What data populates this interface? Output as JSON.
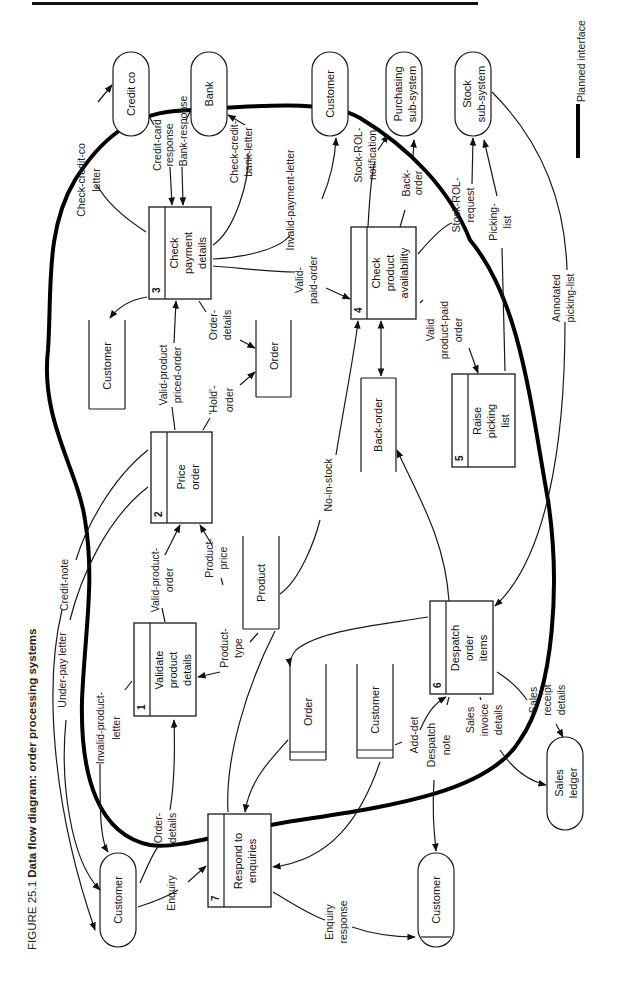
{
  "header": {
    "rule": true
  },
  "caption": {
    "figure_no": "FIGURE 25.1",
    "title": "Data flow diagram: order processing systems"
  },
  "legend": {
    "label": "Planned interface"
  },
  "processes": [
    {
      "num": "1",
      "label": [
        "Validate",
        "product",
        "details"
      ]
    },
    {
      "num": "2",
      "label": [
        "Price",
        "order"
      ]
    },
    {
      "num": "3",
      "label": [
        "Check",
        "payment",
        "details"
      ]
    },
    {
      "num": "4",
      "label": [
        "Check",
        "product",
        "availability"
      ]
    },
    {
      "num": "5",
      "label": [
        "Raise",
        "picking",
        "list"
      ]
    },
    {
      "num": "6",
      "label": [
        "Despatch",
        "order",
        "items"
      ]
    },
    {
      "num": "7",
      "label": [
        "Respond to",
        "enquiries"
      ]
    }
  ],
  "external_entities": [
    {
      "id": "credit-co",
      "label": [
        "Credit co"
      ]
    },
    {
      "id": "bank",
      "label": [
        "Bank"
      ]
    },
    {
      "id": "customer-top",
      "label": [
        "Customer"
      ]
    },
    {
      "id": "purchasing",
      "label": [
        "Purchasing",
        "sub-system"
      ]
    },
    {
      "id": "stock",
      "label": [
        "Stock",
        "sub-system"
      ]
    },
    {
      "id": "customer-left",
      "label": [
        "Customer"
      ]
    },
    {
      "id": "customer-bottom",
      "label": [
        "Customer"
      ]
    },
    {
      "id": "sales-ledger",
      "label": [
        "Sales",
        "ledger"
      ]
    }
  ],
  "data_stores": [
    {
      "id": "customer-store-top",
      "label": "Customer"
    },
    {
      "id": "order-store-top",
      "label": "Order"
    },
    {
      "id": "product-store",
      "label": "Product"
    },
    {
      "id": "back-order-store",
      "label": "Back-order"
    },
    {
      "id": "order-store-bottom",
      "label": "Order"
    },
    {
      "id": "customer-store-bottom",
      "label": "Customer"
    }
  ],
  "flows": {
    "check_credit_co_letter": [
      "Check-credit-co",
      "letter"
    ],
    "credit_card_response": [
      "Credit-card",
      "response"
    ],
    "bank_response": [
      "Bank-response"
    ],
    "check_credit_bank_letter": [
      "Check-credit-",
      "bank-letter"
    ],
    "invalid_payment_letter": [
      "Invalid-payment-letter"
    ],
    "valid_paid_order": [
      "Valid-",
      "paid-order"
    ],
    "stock_rol_notification": [
      "Stock-ROL-",
      "notification"
    ],
    "back_order": [
      "Back-",
      "order"
    ],
    "stock_rol_request": [
      "Stock-ROL-",
      "request"
    ],
    "picking_list": [
      "Picking-",
      "list"
    ],
    "annotated_picking_list": [
      "Annotated",
      "picking-list"
    ],
    "valid_product_paid_order": [
      "Valid",
      "product-paid",
      "order"
    ],
    "no_in_stock": [
      "No-in-stock"
    ],
    "valid_product_priced_order": [
      "Valid-product",
      "priced-order"
    ],
    "order_details_top": [
      "Order-",
      "details"
    ],
    "hold_order": [
      "'Hold'-",
      "order"
    ],
    "credit_note": [
      "Credit-note"
    ],
    "under_pay_letter": [
      "Under-pay letter"
    ],
    "invalid_product_letter": [
      "Invalid-product-",
      "letter"
    ],
    "valid_product_order": [
      "Valid-product-",
      "order"
    ],
    "product_price": [
      "Product-",
      "price"
    ],
    "product_type": [
      "Product-",
      "type"
    ],
    "order_details_left": [
      "Order-",
      "details"
    ],
    "enquiry": [
      "Enquiry"
    ],
    "enquiry_response": [
      "Enquiry",
      "response"
    ],
    "add_det": [
      "Add-det"
    ],
    "despatch_note": [
      "Despatch",
      "note"
    ],
    "sales_invoice_details": [
      "Sales",
      "invoice",
      "details"
    ],
    "sales_receipt_details": [
      "Sales",
      "receipt",
      "details"
    ]
  }
}
